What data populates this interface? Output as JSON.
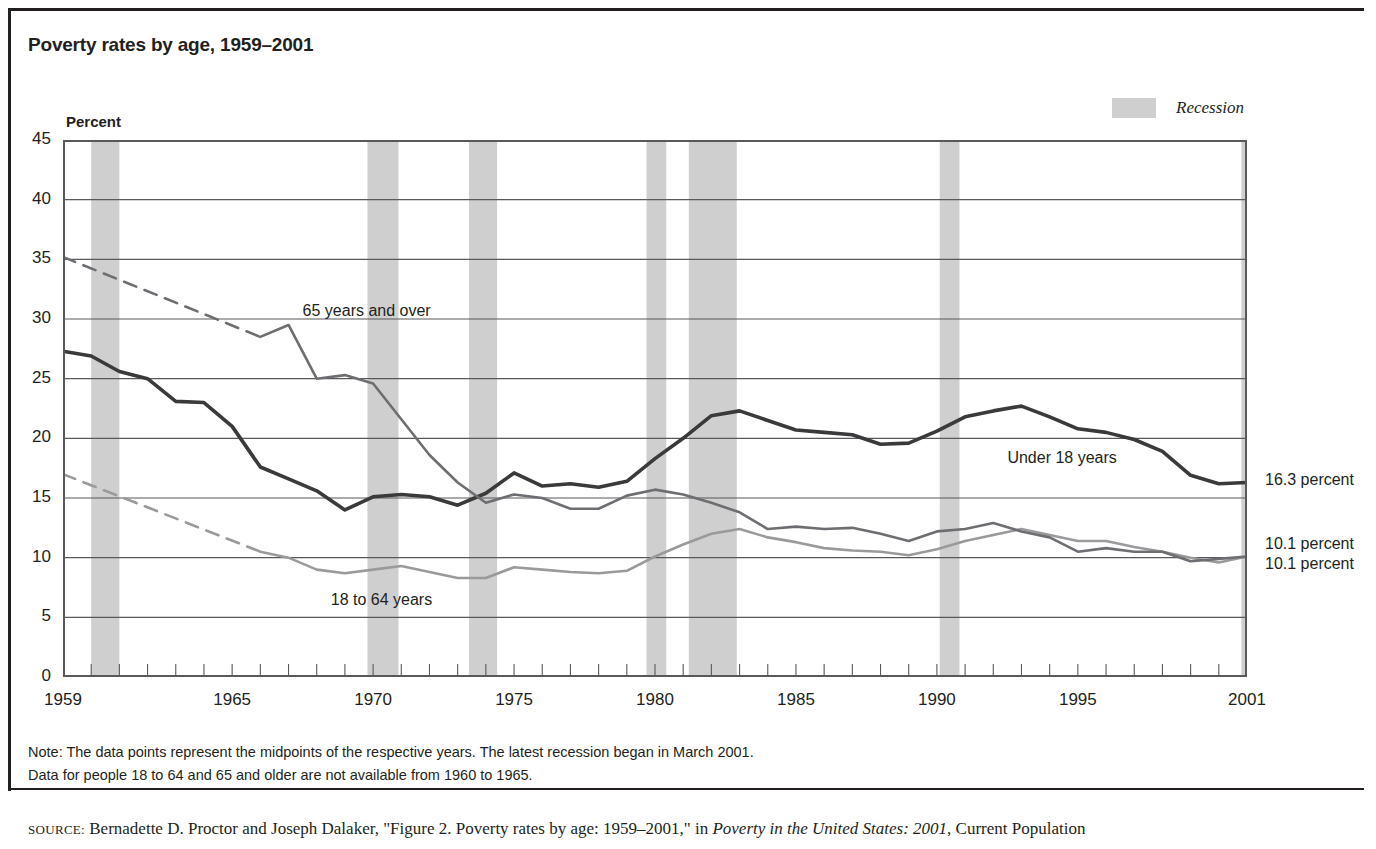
{
  "figure": {
    "title": "Poverty rates by age, 1959–2001",
    "axis_unit_label": "Percent",
    "legend": {
      "recession_label": "Recession",
      "recession_color": "#cfcfcf"
    },
    "notes": [
      "Note: The data points represent the midpoints of the respective years. The latest recession began in March 2001.",
      "Data for people 18 to 64 and 65 and older are not available from 1960 to 1965."
    ],
    "source": {
      "label": "SOURCE:",
      "text_before_italic": " Bernadette D. Proctor and Joseph Dalaker, \"Figure 2. Poverty rates by age: 1959–2001,\" in ",
      "italic_title": "Poverty in the United States: 2001",
      "text_after_italic": ", Current Population"
    }
  },
  "chart_data": {
    "type": "line",
    "title": "Poverty rates by age, 1959–2001",
    "xlabel": "",
    "ylabel": "Percent",
    "xlim": [
      1959,
      2001
    ],
    "ylim": [
      0,
      45
    ],
    "ytick_step": 5,
    "grid": "horizontal",
    "legend_position": "in-plot labels",
    "xticks_labeled": [
      "1959",
      "1965",
      "1970",
      "1975",
      "1980",
      "1985",
      "1990",
      "1995",
      "2001"
    ],
    "yticks": [
      "0",
      "5",
      "10",
      "15",
      "20",
      "25",
      "30",
      "35",
      "40",
      "45"
    ],
    "minor_xticks": "every year 1959-2001",
    "x": [
      1959,
      1960,
      1961,
      1962,
      1963,
      1964,
      1965,
      1966,
      1967,
      1968,
      1969,
      1970,
      1971,
      1972,
      1973,
      1974,
      1975,
      1976,
      1977,
      1978,
      1979,
      1980,
      1981,
      1982,
      1983,
      1984,
      1985,
      1986,
      1987,
      1988,
      1989,
      1990,
      1991,
      1992,
      1993,
      1994,
      1995,
      1996,
      1997,
      1998,
      1999,
      2000,
      2001
    ],
    "series": [
      {
        "name": "Under 18 years",
        "color": "#3a3a3c",
        "style": "solid",
        "end_label": "16.3 percent",
        "values": [
          27.3,
          26.9,
          25.6,
          25.0,
          23.1,
          23.0,
          21.0,
          17.6,
          16.6,
          15.6,
          14.0,
          15.1,
          15.3,
          15.1,
          14.4,
          15.4,
          17.1,
          16.0,
          16.2,
          15.9,
          16.4,
          18.3,
          20.0,
          21.9,
          22.3,
          21.5,
          20.7,
          20.5,
          20.3,
          19.5,
          19.6,
          20.6,
          21.8,
          22.3,
          22.7,
          21.8,
          20.8,
          20.5,
          19.9,
          18.9,
          16.9,
          16.2,
          16.3
        ]
      },
      {
        "name": "18 to 64 years",
        "color": "#9a9a9c",
        "style": "dashed 1959-1966 (data unavailable 1960-1965), solid thereafter",
        "end_label": "10.1 percent",
        "values": [
          17.0,
          null,
          null,
          null,
          null,
          null,
          null,
          10.5,
          10.0,
          9.0,
          8.7,
          9.0,
          9.3,
          8.8,
          8.3,
          8.3,
          9.2,
          9.0,
          8.8,
          8.7,
          8.9,
          10.1,
          11.1,
          12.0,
          12.4,
          11.7,
          11.3,
          10.8,
          10.6,
          10.5,
          10.2,
          10.7,
          11.4,
          11.9,
          12.4,
          11.9,
          11.4,
          11.4,
          10.9,
          10.5,
          10.0,
          9.6,
          10.1
        ]
      },
      {
        "name": "65 years and over",
        "color": "#6d6e71",
        "style": "dashed 1959-1966 (data unavailable 1960-1965), solid thereafter",
        "end_label": "10.1 percent",
        "values": [
          35.2,
          null,
          null,
          null,
          null,
          null,
          null,
          28.5,
          29.5,
          25.0,
          25.3,
          24.6,
          21.6,
          18.6,
          16.3,
          14.6,
          15.3,
          15.0,
          14.1,
          14.1,
          15.2,
          15.7,
          15.3,
          14.6,
          13.8,
          12.4,
          12.6,
          12.4,
          12.5,
          12.0,
          11.4,
          12.2,
          12.4,
          12.9,
          12.2,
          11.7,
          10.5,
          10.8,
          10.5,
          10.5,
          9.7,
          9.9,
          10.1
        ]
      }
    ],
    "recession_bands": [
      {
        "label": "1960–1961",
        "start": 1960.0,
        "end": 1961.0
      },
      {
        "label": "1969–1970",
        "start": 1969.8,
        "end": 1970.9
      },
      {
        "label": "1973–1975",
        "start": 1973.4,
        "end": 1974.4
      },
      {
        "label": "1980",
        "start": 1979.7,
        "end": 1980.4
      },
      {
        "label": "1981–1982",
        "start": 1981.2,
        "end": 1982.9
      },
      {
        "label": "1990–1991",
        "start": 1990.1,
        "end": 1990.8
      },
      {
        "label": "2001",
        "start": 2000.8,
        "end": 2001.4
      }
    ],
    "annotations": [
      {
        "text": "65 years and over",
        "x": 1967.5,
        "y": 30.5
      },
      {
        "text": "18 to 64 years",
        "x": 1968.5,
        "y": 6.3
      },
      {
        "text": "Under 18 years",
        "x": 1992.5,
        "y": 18.2
      }
    ]
  }
}
